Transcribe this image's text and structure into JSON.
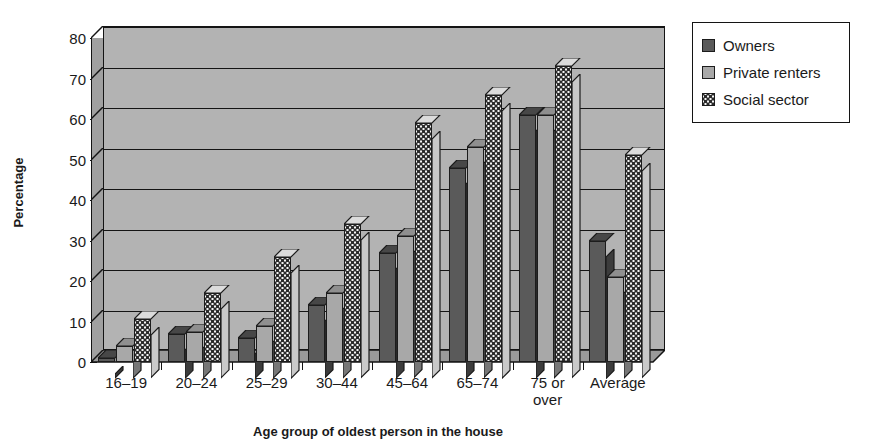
{
  "chart_data": {
    "type": "bar",
    "title": "",
    "subtitle": "",
    "xlabel": "Age group of oldest person in the house",
    "ylabel": "Percentage",
    "categories": [
      "16–19",
      "20–24",
      "25–29",
      "30–44",
      "45–64",
      "65–74",
      "75 or\nover",
      "Average"
    ],
    "series": [
      {
        "name": "Owners",
        "color": "#5a5a5a",
        "values": [
          1,
          7,
          6,
          14,
          27,
          48,
          61,
          30
        ]
      },
      {
        "name": "Private renters",
        "color": "#a8a8a8",
        "values": [
          4,
          7.5,
          9,
          17,
          31,
          53,
          61,
          21
        ]
      },
      {
        "name": "Social sector",
        "color": "#f2f2f2",
        "values": [
          10.5,
          17,
          26,
          34,
          59,
          66,
          73,
          51
        ]
      }
    ],
    "ylim": [
      0,
      80
    ],
    "ytick_labels": [
      "0",
      "10",
      "20",
      "30",
      "40",
      "50",
      "60",
      "70",
      "80"
    ],
    "ytick_values": [
      0,
      10,
      20,
      30,
      40,
      50,
      60,
      70,
      80
    ],
    "grid": true,
    "grid_axis": "y",
    "legend_position": "right",
    "style": "3d-column",
    "plot_background": "#b3b3b3"
  },
  "legend": {
    "items": [
      {
        "label": "Owners",
        "swatch": "owners-swatch"
      },
      {
        "label": "Private renters",
        "swatch": "private-renters-swatch"
      },
      {
        "label": "Social sector",
        "swatch": "social-sector-swatch"
      }
    ]
  },
  "axes": {
    "y_title": "Percentage",
    "x_title": "Age group of oldest person in the house"
  }
}
